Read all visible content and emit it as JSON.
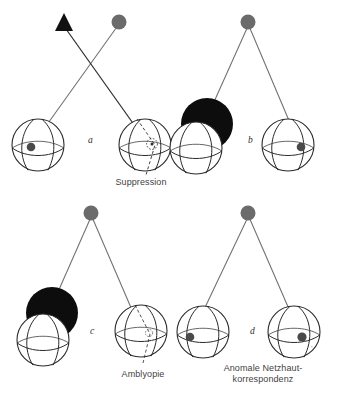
{
  "figure": {
    "domain": "ophthalmology-schematic",
    "background_color": "#ffffff",
    "stroke_color": "#2b2b2b",
    "ray_color": "#6e6e6e",
    "target_gray": "#6b6b6b",
    "target_black": "#111111",
    "occluder_color": "#0d0d0d",
    "text_color": "#3f3f3f"
  },
  "panels": [
    {
      "id": "a",
      "letter": "a",
      "letter_pos": {
        "x": 88,
        "y": 141
      },
      "caption": "Suppression",
      "caption_pos": {
        "x": 113,
        "y": 178
      },
      "condition": "suppression",
      "targets": [
        {
          "name": "deviating-target-triangle",
          "shape": "triangle",
          "color": "#111111",
          "x": 64,
          "y": 25
        },
        {
          "name": "fixation-target-dot",
          "shape": "circle",
          "color": "#6b6b6b",
          "x": 119,
          "y": 22
        },
        {
          "name": "fixation-target-dot",
          "shape": "circle",
          "color": "#6b6b6b",
          "x": 119,
          "y": 22
        }
      ],
      "eyes": [
        {
          "name": "left-eye",
          "cx": 38,
          "cy": 145,
          "r": 26,
          "fovea": {
            "x": 31,
            "y": 147
          },
          "occluded": false,
          "amblyopic": false,
          "scotoma": false
        },
        {
          "name": "right-eye",
          "cx": 145,
          "cy": 145,
          "r": 26,
          "fovea": {
            "x": 152,
            "y": 144
          },
          "occluded": false,
          "amblyopic": false,
          "scotoma": true
        }
      ]
    },
    {
      "id": "b",
      "letter": "b",
      "letter_pos": {
        "x": 248,
        "y": 141
      },
      "caption": "",
      "caption_pos": {
        "x": 0,
        "y": 0
      },
      "condition": "occlusion-of-deviating-eye",
      "targets": [
        {
          "name": "fixation-target-dot",
          "shape": "circle",
          "color": "#6b6b6b",
          "x": 248,
          "y": 22
        }
      ],
      "eyes": [
        {
          "name": "left-eye-occluded",
          "cx": 202,
          "cy": 145,
          "r": 26,
          "fovea": null,
          "occluded": true,
          "amblyopic": false,
          "scotoma": false
        },
        {
          "name": "right-eye",
          "cx": 288,
          "cy": 145,
          "r": 26,
          "fovea": {
            "x": 301,
            "y": 147
          },
          "occluded": false,
          "amblyopic": false,
          "scotoma": false
        }
      ]
    },
    {
      "id": "c",
      "letter": "c",
      "letter_pos": {
        "x": 90,
        "y": 332
      },
      "caption": "Amblyopie",
      "caption_pos": {
        "x": 143,
        "y": 373
      },
      "condition": "amblyopia",
      "targets": [
        {
          "name": "fixation-target-dot",
          "shape": "circle",
          "color": "#6b6b6b",
          "x": 91,
          "y": 213
        }
      ],
      "eyes": [
        {
          "name": "left-eye-occluded",
          "cx": 45,
          "cy": 337,
          "r": 26,
          "fovea": null,
          "occluded": true,
          "amblyopic": false,
          "scotoma": false
        },
        {
          "name": "right-eye-amblyopic",
          "cx": 141,
          "cy": 331,
          "r": 26,
          "fovea": {
            "x": 150,
            "y": 333
          },
          "occluded": false,
          "amblyopic": true,
          "scotoma": false
        }
      ]
    },
    {
      "id": "d",
      "letter": "d",
      "letter_pos": {
        "x": 250,
        "y": 332
      },
      "caption": "Anomale Netzhaut-\nkorrespondenz",
      "caption_line1": "Anomale Netzhaut-",
      "caption_line2": "korrespondenz",
      "caption_pos": {
        "x": 263,
        "y": 367
      },
      "condition": "anomalous-retinal-correspondence",
      "tiny_annotation": "*",
      "tiny_annotation_pos": {
        "x": 311,
        "y": 348
      },
      "targets": [
        {
          "name": "fixation-target-dot",
          "shape": "circle",
          "color": "#6b6b6b",
          "x": 248,
          "y": 213
        }
      ],
      "eyes": [
        {
          "name": "left-eye",
          "cx": 203,
          "cy": 332,
          "r": 26,
          "fovea": {
            "x": 190,
            "y": 337
          },
          "occluded": false,
          "amblyopic": false,
          "scotoma": false
        },
        {
          "name": "right-eye",
          "cx": 294,
          "cy": 332,
          "r": 26,
          "fovea": {
            "x": 302,
            "y": 337
          },
          "occluded": false,
          "amblyopic": false,
          "scotoma": false
        }
      ]
    }
  ],
  "captions": {
    "suppression": "Suppression",
    "amblyopia": "Amblyopie",
    "arc_line1": "Anomale Netzhaut-",
    "arc_line2": "korrespondenz"
  },
  "letters": {
    "a": "a",
    "b": "b",
    "c": "c",
    "d": "d"
  }
}
